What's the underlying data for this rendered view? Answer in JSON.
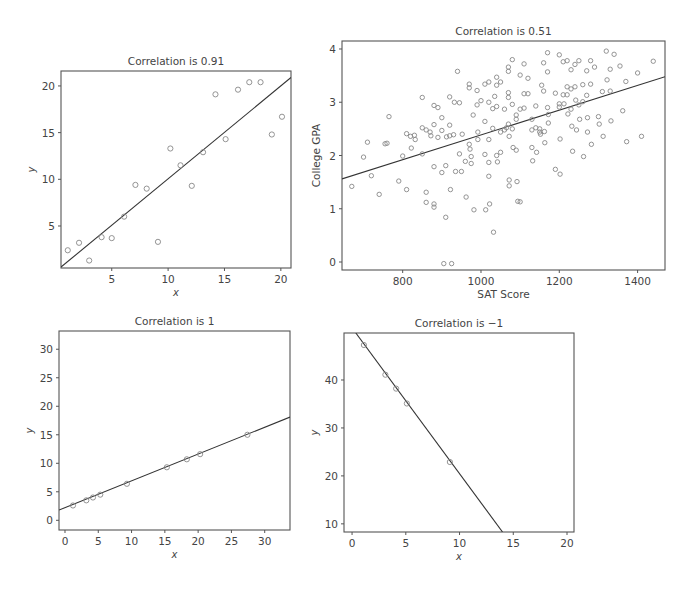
{
  "chart_data": [
    {
      "id": "c1",
      "type": "scatter",
      "title": "Correlation is 0.91",
      "xlabel": "x",
      "ylabel": "y",
      "xlim": [
        0.5,
        20.9
      ],
      "ylim": [
        0.5,
        21.6
      ],
      "xticks": [
        5,
        10,
        15,
        20
      ],
      "yticks": [
        5,
        10,
        15,
        20
      ],
      "fit_line": {
        "x0": 0.5,
        "y0": 0.6,
        "x1": 20.9,
        "y1": 20.9
      },
      "box": {
        "left": 61,
        "top": 71,
        "right": 291,
        "bottom": 268
      },
      "points": [
        [
          1.1,
          2.4
        ],
        [
          2.1,
          3.2
        ],
        [
          3.0,
          1.3
        ],
        [
          4.1,
          3.8
        ],
        [
          5.0,
          3.7
        ],
        [
          6.1,
          6.0
        ],
        [
          7.1,
          9.4
        ],
        [
          8.1,
          9.0
        ],
        [
          9.1,
          3.3
        ],
        [
          10.2,
          13.3
        ],
        [
          11.1,
          11.5
        ],
        [
          12.1,
          9.3
        ],
        [
          13.1,
          12.9
        ],
        [
          14.2,
          19.1
        ],
        [
          15.1,
          14.3
        ],
        [
          16.2,
          19.6
        ],
        [
          17.2,
          20.4
        ],
        [
          18.2,
          20.4
        ],
        [
          19.2,
          14.8
        ],
        [
          20.1,
          16.7
        ]
      ]
    },
    {
      "id": "c2",
      "type": "scatter",
      "title": "Correlation is 0.51",
      "xlabel": "SAT Score",
      "ylabel": "College GPA",
      "xlim": [
        645,
        1470
      ],
      "ylim": [
        -0.15,
        4.15
      ],
      "xticks": [
        800,
        1000,
        1200,
        1400
      ],
      "yticks": [
        0,
        1,
        2,
        3,
        4
      ],
      "fit_line": {
        "x0": 645,
        "y0": 1.56,
        "x1": 1470,
        "y1": 3.48
      },
      "box": {
        "left": 342,
        "top": 41,
        "right": 665,
        "bottom": 270
      },
      "points": [
        [
          670,
          1.42
        ],
        [
          700,
          1.97
        ],
        [
          710,
          2.25
        ],
        [
          720,
          1.62
        ],
        [
          740,
          1.27
        ],
        [
          755,
          2.22
        ],
        [
          760,
          2.23
        ],
        [
          765,
          2.73
        ],
        [
          790,
          1.52
        ],
        [
          800,
          1.99
        ],
        [
          810,
          1.36
        ],
        [
          810,
          2.41
        ],
        [
          820,
          2.36
        ],
        [
          822,
          2.14
        ],
        [
          830,
          2.38
        ],
        [
          832,
          2.3
        ],
        [
          850,
          2.52
        ],
        [
          850,
          3.09
        ],
        [
          850,
          2.03
        ],
        [
          860,
          2.48
        ],
        [
          860,
          1.31
        ],
        [
          860,
          1.12
        ],
        [
          870,
          2.44
        ],
        [
          872,
          2.37
        ],
        [
          880,
          2.58
        ],
        [
          880,
          1.79
        ],
        [
          880,
          2.94
        ],
        [
          880,
          1.09
        ],
        [
          880,
          1.03
        ],
        [
          890,
          2.9
        ],
        [
          890,
          2.34
        ],
        [
          900,
          2.47
        ],
        [
          900,
          2.71
        ],
        [
          900,
          1.68
        ],
        [
          905,
          -0.03
        ],
        [
          910,
          1.81
        ],
        [
          910,
          0.84
        ],
        [
          912,
          2.35
        ],
        [
          920,
          3.1
        ],
        [
          920,
          2.57
        ],
        [
          920,
          2.37
        ],
        [
          922,
          1.36
        ],
        [
          925,
          -0.03
        ],
        [
          930,
          2.39
        ],
        [
          932,
          3.0
        ],
        [
          935,
          1.7
        ],
        [
          940,
          3.58
        ],
        [
          945,
          2.99
        ],
        [
          945,
          2.03
        ],
        [
          950,
          1.7
        ],
        [
          952,
          2.4
        ],
        [
          960,
          1.89
        ],
        [
          962,
          1.22
        ],
        [
          970,
          3.34
        ],
        [
          970,
          3.27
        ],
        [
          970,
          2.21
        ],
        [
          972,
          2.12
        ],
        [
          975,
          1.98
        ],
        [
          975,
          1.85
        ],
        [
          980,
          2.76
        ],
        [
          982,
          0.98
        ],
        [
          990,
          3.22
        ],
        [
          990,
          2.95
        ],
        [
          992,
          2.44
        ],
        [
          992,
          2.3
        ],
        [
          1000,
          3.03
        ],
        [
          1010,
          3.34
        ],
        [
          1010,
          2.64
        ],
        [
          1010,
          2.02
        ],
        [
          1012,
          0.98
        ],
        [
          1020,
          3.38
        ],
        [
          1020,
          3.0
        ],
        [
          1020,
          2.3
        ],
        [
          1020,
          1.87
        ],
        [
          1020,
          1.61
        ],
        [
          1022,
          1.09
        ],
        [
          1030,
          2.88
        ],
        [
          1030,
          2.51
        ],
        [
          1032,
          0.56
        ],
        [
          1035,
          3.11
        ],
        [
          1040,
          3.47
        ],
        [
          1040,
          3.32
        ],
        [
          1040,
          2.92
        ],
        [
          1040,
          2.0
        ],
        [
          1042,
          1.88
        ],
        [
          1050,
          3.38
        ],
        [
          1050,
          2.44
        ],
        [
          1050,
          2.06
        ],
        [
          1060,
          2.87
        ],
        [
          1060,
          2.48
        ],
        [
          1065,
          2.52
        ],
        [
          1070,
          3.66
        ],
        [
          1070,
          3.58
        ],
        [
          1070,
          3.18
        ],
        [
          1070,
          3.09
        ],
        [
          1070,
          2.59
        ],
        [
          1072,
          2.36
        ],
        [
          1072,
          1.54
        ],
        [
          1072,
          1.43
        ],
        [
          1080,
          3.8
        ],
        [
          1080,
          2.96
        ],
        [
          1080,
          2.5
        ],
        [
          1082,
          2.15
        ],
        [
          1090,
          2.76
        ],
        [
          1090,
          2.68
        ],
        [
          1090,
          2.1
        ],
        [
          1092,
          1.51
        ],
        [
          1094,
          1.14
        ],
        [
          1100,
          3.51
        ],
        [
          1100,
          2.87
        ],
        [
          1100,
          1.13
        ],
        [
          1110,
          3.72
        ],
        [
          1110,
          3.16
        ],
        [
          1110,
          2.89
        ],
        [
          1120,
          3.45
        ],
        [
          1120,
          3.16
        ],
        [
          1130,
          2.68
        ],
        [
          1130,
          2.48
        ],
        [
          1130,
          2.15
        ],
        [
          1132,
          1.9
        ],
        [
          1140,
          2.93
        ],
        [
          1140,
          2.52
        ],
        [
          1142,
          2.06
        ],
        [
          1150,
          2.5
        ],
        [
          1150,
          2.44
        ],
        [
          1152,
          2.4
        ],
        [
          1155,
          3.32
        ],
        [
          1160,
          3.74
        ],
        [
          1160,
          3.21
        ],
        [
          1162,
          2.45
        ],
        [
          1163,
          2.24
        ],
        [
          1170,
          3.93
        ],
        [
          1170,
          3.57
        ],
        [
          1170,
          2.9
        ],
        [
          1172,
          2.77
        ],
        [
          1172,
          2.61
        ],
        [
          1190,
          3.17
        ],
        [
          1190,
          1.74
        ],
        [
          1200,
          3.89
        ],
        [
          1200,
          2.97
        ],
        [
          1200,
          2.91
        ],
        [
          1202,
          2.31
        ],
        [
          1202,
          1.65
        ],
        [
          1210,
          3.76
        ],
        [
          1210,
          3.14
        ],
        [
          1212,
          2.97
        ],
        [
          1220,
          3.78
        ],
        [
          1220,
          3.29
        ],
        [
          1220,
          3.14
        ],
        [
          1222,
          2.78
        ],
        [
          1230,
          3.61
        ],
        [
          1230,
          3.25
        ],
        [
          1230,
          2.87
        ],
        [
          1232,
          2.55
        ],
        [
          1234,
          2.08
        ],
        [
          1240,
          3.71
        ],
        [
          1240,
          3.29
        ],
        [
          1242,
          3.04
        ],
        [
          1244,
          2.48
        ],
        [
          1250,
          3.78
        ],
        [
          1250,
          2.95
        ],
        [
          1252,
          2.68
        ],
        [
          1260,
          3.33
        ],
        [
          1260,
          3.01
        ],
        [
          1262,
          1.98
        ],
        [
          1270,
          3.59
        ],
        [
          1270,
          3.13
        ],
        [
          1272,
          2.71
        ],
        [
          1272,
          2.44
        ],
        [
          1280,
          3.78
        ],
        [
          1280,
          3.34
        ],
        [
          1282,
          2.21
        ],
        [
          1290,
          3.66
        ],
        [
          1300,
          2.73
        ],
        [
          1302,
          2.59
        ],
        [
          1310,
          3.2
        ],
        [
          1312,
          2.36
        ],
        [
          1320,
          3.96
        ],
        [
          1322,
          3.42
        ],
        [
          1330,
          3.62
        ],
        [
          1330,
          3.21
        ],
        [
          1332,
          2.65
        ],
        [
          1340,
          3.9
        ],
        [
          1355,
          3.68
        ],
        [
          1362,
          2.84
        ],
        [
          1370,
          3.39
        ],
        [
          1372,
          2.26
        ],
        [
          1400,
          3.55
        ],
        [
          1410,
          2.36
        ],
        [
          1440,
          3.77
        ]
      ]
    },
    {
      "id": "c3",
      "type": "scatter",
      "title": "Correlation is 1",
      "xlabel": "x",
      "ylabel": "y",
      "xlim": [
        -0.9,
        33.8
      ],
      "ylim": [
        -1.7,
        33.2
      ],
      "xticks": [
        0,
        5,
        10,
        15,
        20,
        25,
        30
      ],
      "yticks": [
        0,
        5,
        10,
        15,
        20,
        25,
        30
      ],
      "fit_line": {
        "x0": -0.9,
        "y0": 1.8,
        "x1": 33.8,
        "y1": 18.1
      },
      "box": {
        "left": 59,
        "top": 331,
        "right": 290,
        "bottom": 530
      },
      "points": [
        [
          1.2,
          2.6
        ],
        [
          3.2,
          3.5
        ],
        [
          4.2,
          4.0
        ],
        [
          5.3,
          4.5
        ],
        [
          9.3,
          6.4
        ],
        [
          15.3,
          9.3
        ],
        [
          18.3,
          10.7
        ],
        [
          20.3,
          11.6
        ],
        [
          27.4,
          15.0
        ]
      ]
    },
    {
      "id": "c4",
      "type": "scatter",
      "title": "Correlation is −1",
      "xlabel": "x",
      "ylabel": "y",
      "xlim": [
        -0.75,
        20.65
      ],
      "ylim": [
        8.3,
        49.8
      ],
      "xticks": [
        0,
        5,
        10,
        15,
        20
      ],
      "yticks": [
        10,
        20,
        30,
        40
      ],
      "fit_line": {
        "x0": 0.35,
        "y0": 49.8,
        "x1": 14.0,
        "y1": 8.3
      },
      "box": {
        "left": 344,
        "top": 333,
        "right": 574,
        "bottom": 532
      },
      "points": [
        [
          1.1,
          47.3
        ],
        [
          3.1,
          41.1
        ],
        [
          4.1,
          38.2
        ],
        [
          5.1,
          35.1
        ],
        [
          9.1,
          22.9
        ]
      ]
    }
  ]
}
